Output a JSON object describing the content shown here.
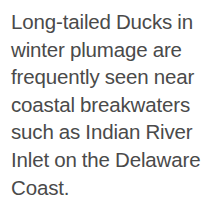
{
  "page": {
    "background_color": "#ffffff"
  },
  "caption": {
    "text": "Long-tailed Ducks in winter plumage are frequently seen near coastal breakwaters such as Indian River Inlet on the Delaware Coast.",
    "text_color": "#4a4a4a",
    "lines": [
      "Long-tailed Ducks in",
      "winter plumage are",
      "frequently seen near",
      "coastal breakwaters",
      "such as Indian River",
      "Inlet on the Delaware",
      "Coast."
    ]
  }
}
